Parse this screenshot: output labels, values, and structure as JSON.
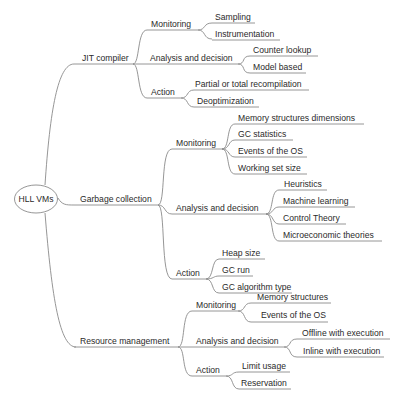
{
  "root": {
    "label": "HLL VMs"
  },
  "branches": [
    {
      "label": "JIT compiler",
      "children": [
        {
          "label": "Monitoring",
          "leaves": [
            "Sampling",
            "Instrumentation"
          ]
        },
        {
          "label": "Analysis and decision",
          "leaves": [
            "Counter lookup",
            "Model based"
          ]
        },
        {
          "label": "Action",
          "leaves": [
            "Partial or total recompilation",
            "Deoptimization"
          ]
        }
      ]
    },
    {
      "label": "Garbage collection",
      "children": [
        {
          "label": "Monitoring",
          "leaves": [
            "Memory structures dimensions",
            "GC statistics",
            "Events of the OS",
            "Working set size"
          ]
        },
        {
          "label": "Analysis and decision",
          "leaves": [
            "Heuristics",
            "Machine learning",
            "Control Theory",
            "Microeconomic theories"
          ]
        },
        {
          "label": "Action",
          "leaves": [
            "Heap size",
            "GC run",
            "GC algorithm type"
          ]
        }
      ]
    },
    {
      "label": "Resource management",
      "children": [
        {
          "label": "Monitoring",
          "leaves": [
            "Memory structures",
            "Events of the OS"
          ]
        },
        {
          "label": "Analysis and decision",
          "leaves": [
            "Offline with execution",
            "Inline with execution"
          ]
        },
        {
          "label": "Action",
          "leaves": [
            "Limit usage",
            "Reservation"
          ]
        }
      ]
    }
  ],
  "colors": {
    "line": "#8a8a8a",
    "text": "#2a2a2a",
    "background": "#ffffff"
  }
}
